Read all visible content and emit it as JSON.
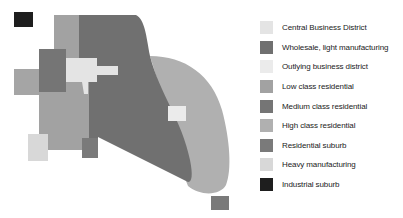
{
  "diagram": {
    "type": "urban-land-use-model",
    "colors": {
      "cbd": "#e4e4e4",
      "wholesale": "#707070",
      "outlying_business": "#ebebeb",
      "low_class": "#a2a2a2",
      "medium_class": "#757575",
      "high_class": "#b0b0b0",
      "residential_suburb": "#7a7a7a",
      "heavy_manufacturing": "#d8d8d8",
      "industrial_suburb": "#1e1e1e"
    }
  },
  "legend": {
    "items": [
      {
        "label": "Central Business District",
        "color": "#e4e4e4"
      },
      {
        "label": "Wholesale, light manufacturing",
        "color": "#707070"
      },
      {
        "label": "Outlying business district",
        "color": "#ebebeb"
      },
      {
        "label": "Low class residential",
        "color": "#a2a2a2"
      },
      {
        "label": "Medium class residential",
        "color": "#757575"
      },
      {
        "label": "High class residential",
        "color": "#b0b0b0"
      },
      {
        "label": "Residential suburb",
        "color": "#7a7a7a"
      },
      {
        "label": "Heavy manufacturing",
        "color": "#d8d8d8"
      },
      {
        "label": "Industrial suburb",
        "color": "#1e1e1e"
      }
    ]
  }
}
